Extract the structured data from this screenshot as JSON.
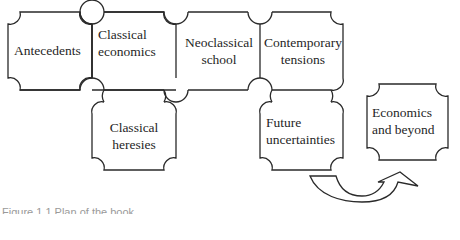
{
  "diagram": {
    "type": "jigsaw-flow",
    "pieces": [
      {
        "id": "antecedents",
        "label": "Antecedents",
        "row": 1,
        "col": 1
      },
      {
        "id": "classical-economics",
        "label_lines": [
          "Classical",
          "economics"
        ],
        "row": 1,
        "col": 2
      },
      {
        "id": "neoclassical-school",
        "label_lines": [
          "Neoclassical",
          "school"
        ],
        "row": 1,
        "col": 3
      },
      {
        "id": "contemporary-tensions",
        "label_lines": [
          "Contemporary",
          "tensions"
        ],
        "row": 1,
        "col": 4
      },
      {
        "id": "classical-heresies",
        "label_lines": [
          "Classical",
          "heresies"
        ],
        "row": 2,
        "col": 2
      },
      {
        "id": "future-uncertainties",
        "label_lines": [
          "Future",
          "uncertainties"
        ],
        "row": 2,
        "col": 4
      },
      {
        "id": "economics-and-beyond",
        "label_lines": [
          "Economics",
          "and beyond"
        ],
        "detached": true
      }
    ],
    "arrow": {
      "from": "future-uncertainties",
      "to": "economics-and-beyond",
      "style": "curved-outline"
    },
    "caption": "Figure 1.1 Plan of the book"
  }
}
